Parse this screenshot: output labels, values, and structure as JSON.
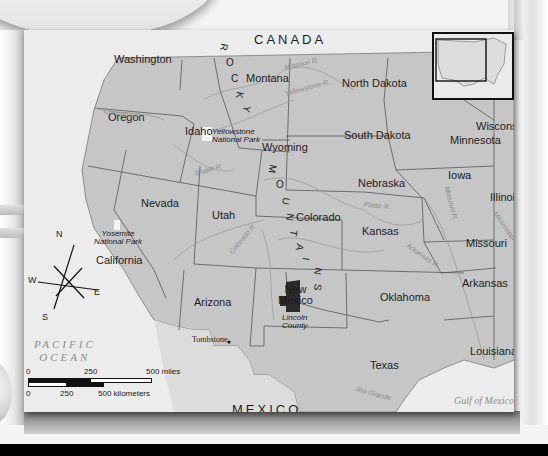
{
  "map": {
    "region": "Western United States",
    "countries": {
      "north": "CANADA",
      "south": "MEXICO"
    },
    "water": {
      "ocean_line1": "PACIFIC",
      "ocean_line2": "OCEAN",
      "gulf": "Gulf of Mexico"
    },
    "states": [
      {
        "name": "Washington"
      },
      {
        "name": "Oregon"
      },
      {
        "name": "Idaho"
      },
      {
        "name": "Montana"
      },
      {
        "name": "Wyoming"
      },
      {
        "name": "North Dakota"
      },
      {
        "name": "South Dakota"
      },
      {
        "name": "Nebraska"
      },
      {
        "name": "Nevada"
      },
      {
        "name": "Utah"
      },
      {
        "name": "Colorado"
      },
      {
        "name": "Kansas"
      },
      {
        "name": "California"
      },
      {
        "name": "Arizona"
      },
      {
        "name": "New Mexico"
      },
      {
        "name": "Oklahoma"
      },
      {
        "name": "Texas"
      },
      {
        "name": "Minnesota"
      },
      {
        "name": "Wisconsin"
      },
      {
        "name": "Iowa"
      },
      {
        "name": "Illinois"
      },
      {
        "name": "Missouri"
      },
      {
        "name": "Arkansas"
      },
      {
        "name": "Louisiana"
      }
    ],
    "new_mexico_line1": "New",
    "new_mexico_line2": "Mexico",
    "parks": [
      {
        "line1": "Yellowstone",
        "line2": "National Park"
      },
      {
        "line1": "Yosemite",
        "line2": "National Park"
      }
    ],
    "county": {
      "line1": "Lincoln",
      "line2": "County"
    },
    "town": "Tombstone",
    "mountains_letters": [
      "R",
      "O",
      "C",
      "K",
      "Y",
      "M",
      "O",
      "U",
      "N",
      "T",
      "A",
      "I",
      "N",
      "S"
    ],
    "rivers": [
      "Missouri R.",
      "Yellowstone R.",
      "Columbia R.",
      "Snake R.",
      "Colorado R.",
      "Platte R.",
      "Arkansas R.",
      "Missouri R.",
      "Mississippi R.",
      "Rio Grande"
    ],
    "compass": {
      "n": "N",
      "s": "S",
      "e": "E",
      "w": "W"
    },
    "scale": {
      "miles": [
        "0",
        "250",
        "500 miles"
      ],
      "km": [
        "0",
        "250",
        "500 kilometers"
      ]
    },
    "colors": {
      "land": "#c6c6c6",
      "water": "#ececec",
      "border": "#555555",
      "county": "#2a2a2a"
    }
  }
}
